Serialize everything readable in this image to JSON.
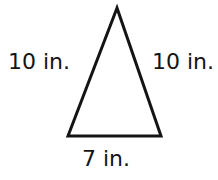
{
  "figure": {
    "type": "isosceles-triangle-diagram",
    "background_color": "#ffffff",
    "stroke_color": "#141414",
    "labels": {
      "left_side": "10 in.",
      "right_side": "10 in.",
      "base": "7 in."
    }
  }
}
